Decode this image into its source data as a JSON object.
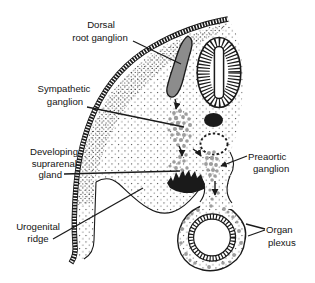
{
  "figure": {
    "type": "anatomical-diagram"
  },
  "labels": {
    "dorsal_root_ganglion": {
      "line1": "Dorsal",
      "line2": "root ganglion"
    },
    "sympathetic_ganglion": {
      "line1": "Sympathetic",
      "line2": "ganglion"
    },
    "developing_suprarenal_gland": {
      "line1": "Developing",
      "line2": "suprarenal",
      "line3": "gland"
    },
    "preaortic_ganglion": {
      "line1": "Preaortic",
      "line2": "ganglion"
    },
    "urogenital_ridge": {
      "line1": "Urogenital",
      "line2": "ridge"
    },
    "organ_plexus": {
      "line1": "Organ",
      "line2": "plexus"
    }
  },
  "colors": {
    "ink": "#1a1a1a",
    "ganglion_gray": "#8c8c8c",
    "cell_dot_gray": "#9d9d9d",
    "background": "#ffffff"
  }
}
